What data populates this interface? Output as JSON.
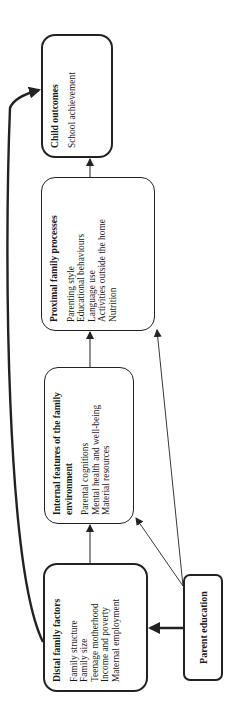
{
  "diagram": {
    "orientation": "rotated 90 degrees counter-clockwise",
    "boxes": {
      "distal": {
        "title": "Distal family factors",
        "items": [
          "Family structure",
          "Family size",
          "Teenage motherhood",
          "Income and poverty",
          "Maternal employment"
        ]
      },
      "internal": {
        "title": "Internal features of the family environment",
        "items": [
          "Parental cognitions",
          "Mental health and well-being",
          "Material resources"
        ]
      },
      "proximal": {
        "title": "Proximal family processes",
        "items": [
          "Parenting style",
          "Educational behaviours",
          "Language use",
          "Activities outside the home",
          "Nutrition"
        ]
      },
      "child": {
        "title": "Child outcomes",
        "items": [
          "School achievement"
        ]
      },
      "parent_education": {
        "title": "Parent education"
      }
    },
    "edges": [
      {
        "from": "Distal family factors",
        "to": "Internal features of the family environment",
        "style": "thin"
      },
      {
        "from": "Internal features of the family environment",
        "to": "Proximal family processes",
        "style": "thin"
      },
      {
        "from": "Proximal family processes",
        "to": "Child outcomes",
        "style": "thin"
      },
      {
        "from": "Distal family factors",
        "to": "Child outcomes",
        "style": "thick-curved"
      },
      {
        "from": "Parent education",
        "to": "Distal family factors",
        "style": "thick"
      },
      {
        "from": "Parent education",
        "to": "Internal features of the family environment",
        "style": "thin-diagonal"
      },
      {
        "from": "Parent education",
        "to": "Proximal family processes",
        "style": "thin-diagonal"
      }
    ],
    "colors": {
      "stroke": "#222222",
      "background": "#ffffff",
      "text": "#1a1a1a"
    }
  }
}
